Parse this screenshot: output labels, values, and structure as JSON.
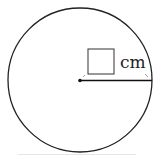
{
  "diagram": {
    "type": "circle-radius",
    "unit_label": "cm",
    "answer_box": "",
    "colors": {
      "stroke": "#222222",
      "background": "#ffffff"
    }
  }
}
